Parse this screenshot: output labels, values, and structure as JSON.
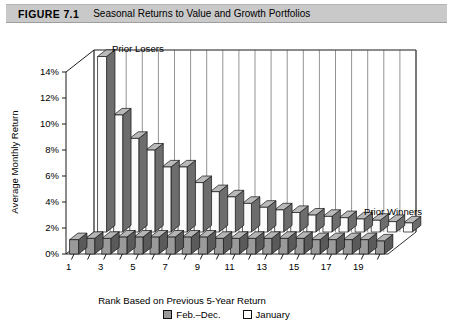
{
  "header": {
    "figure_number": "FIGURE 7.1",
    "title": "Seasonal Returns to Value and Growth Portfolios",
    "band_color": "#c9c9c9"
  },
  "annotations": {
    "left": "Prior Losers",
    "right": "Prior Winners"
  },
  "legend": {
    "items": [
      {
        "label": "Feb.–Dec.",
        "color": "#9a9a9a"
      },
      {
        "label": "January",
        "color": "#ffffff"
      }
    ]
  },
  "chart_data": {
    "type": "bar",
    "title": "Seasonal Returns to Value and Growth Portfolios",
    "xlabel": "Rank Based on Previous 5-Year Return",
    "ylabel": "Average Monthly Return",
    "ylim": [
      0,
      14
    ],
    "yticks": [
      "0%",
      "2%",
      "4%",
      "6%",
      "8%",
      "10%",
      "12%",
      "14%"
    ],
    "ytick_values": [
      0,
      2,
      4,
      6,
      8,
      10,
      12,
      14
    ],
    "grid": true,
    "legend_position": "bottom",
    "projection": "3d",
    "categories": [
      "1",
      "2",
      "3",
      "4",
      "5",
      "6",
      "7",
      "8",
      "9",
      "10",
      "11",
      "12",
      "13",
      "14",
      "15",
      "16",
      "17",
      "18",
      "19",
      "20"
    ],
    "xtick_labels_shown": [
      "1",
      "3",
      "5",
      "7",
      "9",
      "11",
      "13",
      "15",
      "17",
      "19"
    ],
    "series": [
      {
        "name": "January",
        "color": "#ffffff",
        "values": [
          13.5,
          9.0,
          7.2,
          6.3,
          5.0,
          5.0,
          3.8,
          3.1,
          2.7,
          2.2,
          1.9,
          1.7,
          1.5,
          1.3,
          1.2,
          1.1,
          1.0,
          0.9,
          0.8,
          0.7
        ]
      },
      {
        "name": "Feb.–Dec.",
        "color": "#9a9a9a",
        "values": [
          1.1,
          1.2,
          1.2,
          1.3,
          1.3,
          1.3,
          1.3,
          1.3,
          1.3,
          1.2,
          1.2,
          1.2,
          1.2,
          1.2,
          1.2,
          1.1,
          1.1,
          1.1,
          1.1,
          1.0
        ]
      }
    ],
    "annotations": [
      {
        "text": "Prior Losers",
        "at_category": "1"
      },
      {
        "text": "Prior Winners",
        "at_category": "20"
      }
    ]
  }
}
